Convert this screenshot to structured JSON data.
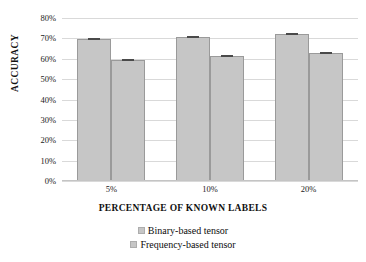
{
  "chart_data": {
    "type": "bar",
    "title": "",
    "xlabel": "PERCENTAGE OF KNOWN LABELS",
    "ylabel": "ACCURACY",
    "categories": [
      "5%",
      "10%",
      "20%"
    ],
    "series": [
      {
        "name": "Binary-based tensor",
        "values": [
          69.5,
          70.5,
          72.0
        ],
        "color": "#c6c6c6"
      },
      {
        "name": "Frequency-based tensor",
        "values": [
          59.5,
          61.5,
          63.0
        ],
        "color": "#c6c6c6"
      }
    ],
    "ylim": [
      0,
      80
    ],
    "ytick_values": [
      0,
      10,
      20,
      30,
      40,
      50,
      60,
      70,
      80
    ],
    "ytick_labels": [
      "0%",
      "10%",
      "20%",
      "30%",
      "40%",
      "50%",
      "60%",
      "70%",
      "80%"
    ],
    "yaxis_unit": "%",
    "grid": "horizontal",
    "legend_position": "bottom",
    "error_bars": true,
    "annotations": []
  },
  "legend": {
    "items": [
      {
        "label": "Binary-based tensor",
        "swatch": "#c6c6c6"
      },
      {
        "label": "Frequency-based tensor",
        "swatch": "#c6c6c6"
      }
    ]
  },
  "colors": {
    "bar_fill": "#c6c6c6",
    "bar_border": "#9a9a9a",
    "gridline": "#d9d9d9",
    "error_cap": "#4a4a4a",
    "text": "#111111",
    "background": "#ffffff"
  }
}
